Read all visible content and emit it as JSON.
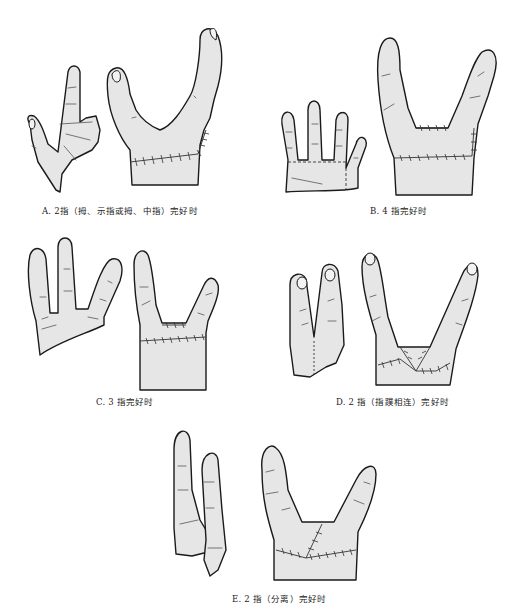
{
  "figure": {
    "panels": [
      {
        "id": "A",
        "caption": "A. 2指（拇、示指或拇、中指）完好时",
        "left_part": "donor hand remnant with thumb and index finger",
        "right_part": "reconstructed hand with two digits and transverse suture line"
      },
      {
        "id": "B",
        "caption": "B. 4 指完好时",
        "left_part": "amputated four-finger segment with dashed cut lines",
        "right_part": "reconstructed hand with two digits and suture lines"
      },
      {
        "id": "C",
        "caption": "C. 3 指完好时",
        "left_part": "three-finger segment",
        "right_part": "reconstructed hand with two digits"
      },
      {
        "id": "D",
        "caption": "D. 2 指（指蹼相连）完好时",
        "left_part": "two fingers joined by web",
        "right_part": "reconstructed hand with crossed sutures"
      },
      {
        "id": "E",
        "caption": "E. 2 指（分离）完好时",
        "left_part": "two separated fingers",
        "right_part": "reconstructed hand with oblique and transverse sutures"
      }
    ],
    "colors": {
      "skin_fill": "#e6e6e6",
      "outline": "#1a1a1a",
      "background": "#ffffff"
    }
  }
}
